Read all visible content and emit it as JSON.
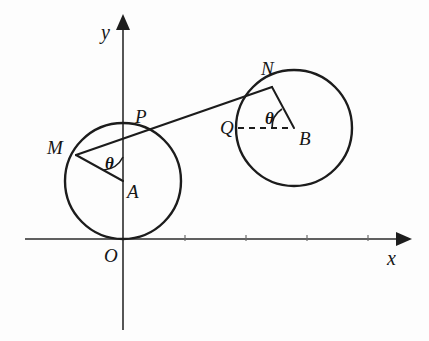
{
  "figure": {
    "background_color": "#fdfdfd",
    "ink_color": "#1c1c1c",
    "width": 429,
    "height": 341
  },
  "axes": {
    "x_axis": {
      "label": "x",
      "y_pixel": 239,
      "x_start": 25,
      "x_end": 408,
      "has_arrow": true
    },
    "y_axis": {
      "label": "y",
      "x_pixel": 123,
      "y_start": 330,
      "y_end": 18,
      "has_arrow": true
    },
    "origin": {
      "label": "O",
      "x": 123,
      "y": 239
    },
    "ticks": [
      {
        "x": 185,
        "y": 239
      },
      {
        "x": 246,
        "y": 239
      },
      {
        "x": 307,
        "y": 239
      },
      {
        "x": 368,
        "y": 239
      }
    ]
  },
  "circles": [
    {
      "name": "circle-A",
      "center_label": "A",
      "cx": 123,
      "cy": 181,
      "r": 58,
      "tangent_to": "x-axis at O"
    },
    {
      "name": "circle-B",
      "center_label": "B",
      "cx": 294,
      "cy": 128,
      "r": 58,
      "tangent_to": "line MN at N"
    }
  ],
  "points": [
    {
      "id": "O",
      "label": "O",
      "x": 123,
      "y": 239,
      "label_x": 104,
      "label_y": 246
    },
    {
      "id": "A",
      "label": "A",
      "x": 123,
      "y": 181,
      "label_x": 127,
      "label_y": 182
    },
    {
      "id": "B",
      "label": "B",
      "x": 294,
      "y": 128,
      "label_x": 299,
      "label_y": 129
    },
    {
      "id": "M",
      "label": "M",
      "x": 76,
      "y": 155,
      "label_x": 47,
      "label_y": 138
    },
    {
      "id": "N",
      "label": "N",
      "x": 272,
      "y": 87,
      "label_x": 261,
      "label_y": 59
    },
    {
      "id": "P",
      "label": "P",
      "x": 138,
      "y": 134,
      "label_x": 135,
      "label_y": 107
    },
    {
      "id": "Q",
      "label": "Q",
      "x": 236,
      "y": 128,
      "label_x": 220,
      "label_y": 118
    }
  ],
  "segments": [
    {
      "name": "tangent-line-MN",
      "from": "M",
      "to": "N",
      "style": "solid"
    },
    {
      "name": "radius-AM",
      "from": "A",
      "to": "M",
      "style": "solid"
    },
    {
      "name": "radius-BN",
      "from": "B",
      "to": "N",
      "style": "solid"
    },
    {
      "name": "reference-QB",
      "from": "Q",
      "to": "B",
      "style": "dashed"
    }
  ],
  "angles": [
    {
      "name": "angle-at-A",
      "symbol": "θ",
      "vertex": "A",
      "label_x": 105,
      "label_y": 155,
      "between": [
        "AM",
        "A-upward-vertical"
      ]
    },
    {
      "name": "angle-at-B",
      "symbol": "θ",
      "vertex": "B",
      "label_x": 265,
      "label_y": 110,
      "between": [
        "BN",
        "BQ"
      ]
    }
  ],
  "labels": {
    "x_axis_label_x": 387,
    "x_axis_label_y": 248,
    "y_axis_label_x": 101,
    "y_axis_label_y": 22
  }
}
